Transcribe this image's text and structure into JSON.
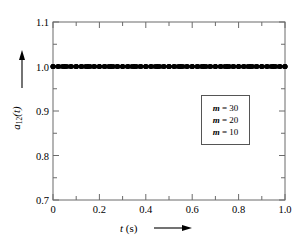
{
  "chart_data": {
    "type": "line",
    "title": "",
    "subtitle": "",
    "xlabel": "t (s)",
    "ylabel": "a_12(t)",
    "xlim": [
      0,
      1.0
    ],
    "ylim": [
      0.7,
      1.1
    ],
    "xticks": [
      "0",
      "0.2",
      "0.4",
      "0.6",
      "0.8",
      "1.0"
    ],
    "xtick_values": [
      0,
      0.2,
      0.4,
      0.6,
      0.8,
      1.0
    ],
    "yticks": [
      "1.1",
      "1.0",
      "0.9",
      "0.8",
      "0.7"
    ],
    "ytick_values": [
      1.1,
      1.0,
      0.9,
      0.8,
      0.7
    ],
    "minor_ticks_per_interval": 1,
    "grid": false,
    "legend_position": "center-right",
    "legend_entries": [
      "m = 30",
      "m = 20",
      "m = 10"
    ],
    "marker": "filled-circle",
    "line_color": "#000000",
    "marker_color": "#000000",
    "series": [
      {
        "name": "m = 30",
        "x": [
          0,
          0.02,
          0.04,
          0.06,
          0.08,
          0.1,
          0.12,
          0.14,
          0.16,
          0.18,
          0.2,
          0.22,
          0.24,
          0.26,
          0.28,
          0.3,
          0.32,
          0.34,
          0.36,
          0.38,
          0.4,
          0.42,
          0.44,
          0.46,
          0.48,
          0.5,
          0.52,
          0.54,
          0.56,
          0.58,
          0.6,
          0.62,
          0.64,
          0.66,
          0.68,
          0.7,
          0.72,
          0.74,
          0.76,
          0.78,
          0.8,
          0.82,
          0.84,
          0.86,
          0.88,
          0.9,
          0.92,
          0.94,
          0.96,
          0.98,
          1.0
        ],
        "values": [
          1.0,
          1.0,
          1.0,
          1.0,
          1.0,
          1.0,
          1.0,
          1.0,
          1.0,
          1.0,
          1.0,
          1.0,
          1.0,
          1.0,
          1.0,
          1.0,
          1.0,
          1.0,
          1.0,
          1.0,
          1.0,
          1.0,
          1.0,
          1.0,
          1.0,
          1.0,
          1.0,
          1.0,
          1.0,
          1.0,
          1.0,
          1.0,
          1.0,
          1.0,
          1.0,
          1.0,
          1.0,
          1.0,
          1.0,
          1.0,
          1.0,
          1.0,
          1.0,
          1.0,
          1.0,
          1.0,
          1.0,
          1.0,
          1.0,
          1.0,
          1.0
        ]
      },
      {
        "name": "m = 20",
        "x": [
          0,
          0.025,
          0.05,
          0.075,
          0.1,
          0.125,
          0.15,
          0.175,
          0.2,
          0.225,
          0.25,
          0.275,
          0.3,
          0.325,
          0.35,
          0.375,
          0.4,
          0.425,
          0.45,
          0.475,
          0.5,
          0.525,
          0.55,
          0.575,
          0.6,
          0.625,
          0.65,
          0.675,
          0.7,
          0.725,
          0.75,
          0.775,
          0.8,
          0.825,
          0.85,
          0.875,
          0.9,
          0.925,
          0.95,
          0.975,
          1.0
        ],
        "values": [
          1.0,
          1.0,
          1.0,
          1.0,
          1.0,
          1.0,
          1.0,
          1.0,
          1.0,
          1.0,
          1.0,
          1.0,
          1.0,
          1.0,
          1.0,
          1.0,
          1.0,
          1.0,
          1.0,
          1.0,
          1.0,
          1.0,
          1.0,
          1.0,
          1.0,
          1.0,
          1.0,
          1.0,
          1.0,
          1.0,
          1.0,
          1.0,
          1.0,
          1.0,
          1.0,
          1.0,
          1.0,
          1.0,
          1.0,
          1.0,
          1.0
        ]
      },
      {
        "name": "m = 10",
        "x": [
          0,
          0.05,
          0.1,
          0.15,
          0.2,
          0.25,
          0.3,
          0.35,
          0.4,
          0.45,
          0.5,
          0.55,
          0.6,
          0.65,
          0.7,
          0.75,
          0.8,
          0.85,
          0.9,
          0.95,
          1.0
        ],
        "values": [
          1.0,
          1.0,
          1.0,
          1.0,
          1.0,
          1.0,
          1.0,
          1.0,
          1.0,
          1.0,
          1.0,
          1.0,
          1.0,
          1.0,
          1.0,
          1.0,
          1.0,
          1.0,
          1.0,
          1.0,
          1.0
        ]
      }
    ],
    "annotations": [
      {
        "name": "y-axis-arrow",
        "direction": "up"
      },
      {
        "name": "x-axis-arrow",
        "direction": "right"
      }
    ]
  },
  "axis": {
    "y_label_main": "a",
    "y_label_sub": "12",
    "y_label_tail": "(t)",
    "x_label_var": "t",
    "x_label_unit": "(s)"
  },
  "legend": {
    "rows": [
      {
        "var": "m",
        "eq": "= 30"
      },
      {
        "var": "m",
        "eq": "= 20"
      },
      {
        "var": "m",
        "eq": "= 10"
      }
    ]
  },
  "ticklabels": {
    "y": [
      "1.1",
      "1.0",
      "0.9",
      "0.8",
      "0.7"
    ],
    "x": [
      "0",
      "0.2",
      "0.4",
      "0.6",
      "0.8",
      "1.0"
    ]
  }
}
